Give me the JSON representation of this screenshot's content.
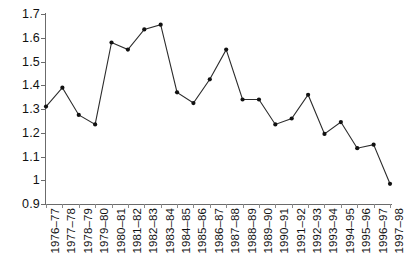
{
  "chart_data": {
    "type": "line",
    "title": "",
    "subtitle": "",
    "xlabel": "",
    "ylabel": "",
    "ylim": [
      0.9,
      1.7
    ],
    "ytick_step": 0.1,
    "ytick_labels": [
      "1.7",
      "1.6",
      "1.5",
      "1.4",
      "1.3",
      "1.2",
      "1.1",
      "1",
      "0.9"
    ],
    "ytick_values": [
      1.7,
      1.6,
      1.5,
      1.4,
      1.3,
      1.2,
      1.1,
      1.0,
      0.9
    ],
    "grid": false,
    "legend": false,
    "legend_position": "none",
    "marker": "dot",
    "line_color": "#2b2b2b",
    "marker_color": "#111111",
    "axis_color": "#6b6b6b",
    "categories": [
      "1976–77",
      "1977–78",
      "1978–79",
      "1979–80",
      "1980–81",
      "1981–82",
      "1982–83",
      "1983–84",
      "1984–85",
      "1985–86",
      "1986–87",
      "1987–88",
      "1988–89",
      "1989–90",
      "1990–91",
      "1991–92",
      "1992–93",
      "1993–94",
      "1994–95",
      "1995–96",
      "1996–97",
      "1997–98"
    ],
    "values": [
      1.31,
      1.39,
      1.275,
      1.235,
      1.58,
      1.55,
      1.635,
      1.655,
      1.37,
      1.325,
      1.425,
      1.55,
      1.34,
      1.34,
      1.235,
      1.26,
      1.36,
      1.195,
      1.245,
      1.135,
      1.15,
      0.985
    ],
    "series": [
      {
        "name": "series-1",
        "values": [
          1.31,
          1.39,
          1.275,
          1.235,
          1.58,
          1.55,
          1.635,
          1.655,
          1.37,
          1.325,
          1.425,
          1.55,
          1.34,
          1.34,
          1.235,
          1.26,
          1.36,
          1.195,
          1.245,
          1.135,
          1.15,
          0.985
        ]
      }
    ]
  }
}
